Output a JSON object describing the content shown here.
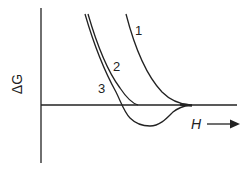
{
  "diagram": {
    "type": "free-energy-vs-field",
    "y_axis_label": "ΔG",
    "x_axis_label": "H",
    "x_axis_arrow": "right-arrow",
    "curves": [
      {
        "label": "1",
        "description": "steep curve descending to zero, tangent to axis"
      },
      {
        "label": "2",
        "description": "descends and meets zero axis"
      },
      {
        "label": "3",
        "description": "crosses zero, dips to negative minimum, returns to zero"
      }
    ],
    "colors": {
      "line": "#222222",
      "background": "#ffffff"
    }
  }
}
